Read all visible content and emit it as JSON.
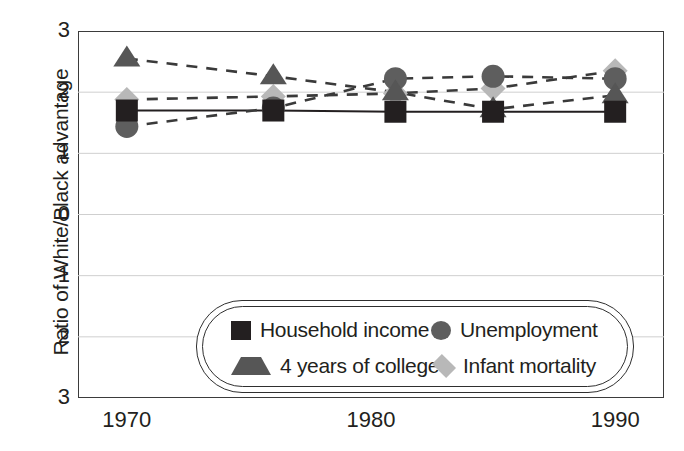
{
  "chart_data": {
    "type": "scatter",
    "title": "",
    "subtitle": "",
    "xlabel": "",
    "ylabel": "Ratio of White/Black advantage",
    "xlim": [
      1968,
      1992
    ],
    "ylim": [
      -3,
      3
    ],
    "grid": true,
    "legend_position": "inside-bottom-center",
    "x_tick_labels": [
      "1970",
      "1980",
      "1990"
    ],
    "x_tick_values": [
      1970,
      1980,
      1990
    ],
    "y_tick_labels": [
      "3",
      "2",
      "1",
      "0",
      "1",
      "2",
      "3"
    ],
    "y_tick_values": [
      3,
      2,
      1,
      0,
      -1,
      -2,
      -3
    ],
    "x": [
      1970,
      1976,
      1981,
      1985,
      1990
    ],
    "series": [
      {
        "name": "Household income",
        "marker": "square",
        "color": "#231f20",
        "line": "solid",
        "values": [
          1.7,
          1.7,
          1.68,
          1.68,
          1.68
        ]
      },
      {
        "name": "Unemployment",
        "marker": "circle",
        "color": "#5e5e5e",
        "line": "dashed",
        "values": [
          1.44,
          1.74,
          2.22,
          2.26,
          2.22
        ]
      },
      {
        "name": "4 years of college",
        "marker": "triangle",
        "color": "#565656",
        "line": "dashed",
        "values": [
          2.55,
          2.26,
          2.0,
          1.72,
          1.95
        ]
      },
      {
        "name": "Infant mortality",
        "marker": "diamond",
        "color": "#b8b8b8",
        "line": "dashed",
        "values": [
          1.88,
          1.93,
          1.98,
          2.06,
          2.35
        ]
      }
    ]
  },
  "axis": {
    "y_title": "Ratio of White/Black advantage"
  },
  "legend": {
    "entries": [
      {
        "label": "Household income",
        "swatch": "square-marker-icon"
      },
      {
        "label": "Unemployment",
        "swatch": "circle-marker-icon"
      },
      {
        "label": "4 years of college",
        "swatch": "triangle-marker-icon"
      },
      {
        "label": "Infant mortality",
        "swatch": "diamond-marker-icon"
      }
    ]
  }
}
